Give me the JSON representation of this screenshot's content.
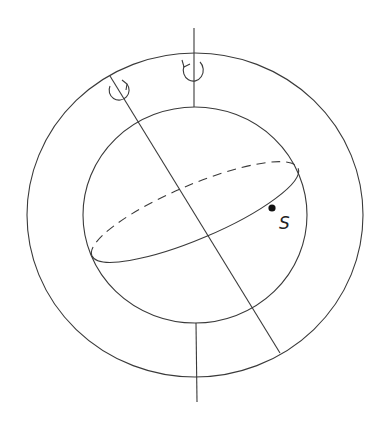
{
  "diagram": {
    "colors": {
      "stroke": "#3a3a3a",
      "background": "#ffffff",
      "point": "#111111"
    },
    "outer_shell": {
      "cx": 195,
      "cy": 215,
      "rx": 168,
      "ry": 162
    },
    "inner_sphere": {
      "cx": 195,
      "cy": 215,
      "rx": 112,
      "ry": 108
    },
    "vertical_axis": {
      "x": 194,
      "top": 28,
      "bottom": 402,
      "rotation_icon": "counterclockwise-arrow-icon"
    },
    "tilted_axis": {
      "x1": 110,
      "y1": 76,
      "x2": 280,
      "y2": 353,
      "rotation_icon": "counterclockwise-arrow-icon"
    },
    "equator": {
      "cx": 195,
      "cy": 212,
      "rx": 112,
      "ry": 27,
      "rotation_deg": -23
    },
    "point": {
      "x": 272,
      "y": 208,
      "label": "S"
    }
  }
}
